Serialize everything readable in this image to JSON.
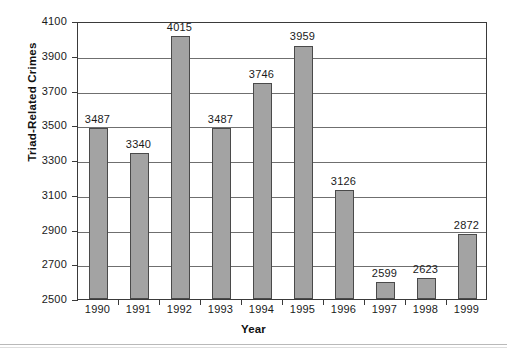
{
  "chart_data": {
    "type": "bar",
    "title": "",
    "subtitle": "",
    "xlabel": "Year",
    "ylabel": "Triad-Related Crimes",
    "categories": [
      "1990",
      "1991",
      "1992",
      "1993",
      "1994",
      "1995",
      "1996",
      "1997",
      "1998",
      "1999"
    ],
    "values": [
      3487,
      3340,
      4015,
      3487,
      3746,
      3959,
      3126,
      2599,
      2623,
      2872
    ],
    "data_labels": [
      "3487",
      "3340",
      "4015",
      "3487",
      "3746",
      "3959",
      "3126",
      "2599",
      "2623",
      "2872"
    ],
    "ylim": [
      2500,
      4100
    ],
    "ytick_values": [
      2500,
      2700,
      2900,
      3100,
      3300,
      3500,
      3700,
      3900,
      4100
    ],
    "ytick_labels": [
      "2500",
      "2700",
      "2900",
      "3100",
      "3300",
      "3500",
      "3700",
      "3900",
      "4100"
    ],
    "ytick_step": 200,
    "grid": true,
    "grid_axis": "y",
    "legend": false,
    "legend_position": "none",
    "series": [
      {
        "name": "Triad-Related Crimes",
        "values": [
          3487,
          3340,
          4015,
          3487,
          3746,
          3959,
          3126,
          2599,
          2623,
          2872
        ]
      }
    ],
    "colors": {
      "bar_fill": "#a3a3a3",
      "bar_stroke": "#4a4a4a",
      "gridline": "#6f6f6f",
      "axis": "#3a3a3a",
      "text": "#1a1a1a",
      "background": "#ffffff"
    }
  }
}
